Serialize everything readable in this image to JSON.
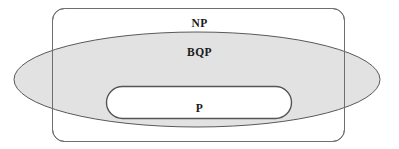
{
  "diagram": {
    "kind": "containment-venn-diagram",
    "background_color": "#ffffff",
    "regions": [
      {
        "id": "np",
        "label": "NP",
        "shape": "rounded-rectangle",
        "fill_color": "#ffffff",
        "stroke_color": "#6e6e6e",
        "stroke_width": 1,
        "x": 52,
        "y": 8,
        "width": 293,
        "height": 134,
        "corner_radius": 12,
        "label_x": 199,
        "label_y": 17
      },
      {
        "id": "bqp",
        "label": "BQP",
        "shape": "ellipse",
        "fill_color": "#dfdfdf",
        "stroke_color": "#595959",
        "stroke_width": 1,
        "center_x": 197,
        "center_y": 79.5,
        "radius_x": 183,
        "radius_y": 47.5,
        "label_x": 199,
        "label_y": 46
      },
      {
        "id": "p",
        "label": "P",
        "shape": "rounded-rectangle",
        "fill_color": "#ffffff",
        "stroke_color": "#555555",
        "stroke_width": 1.4,
        "x": 106,
        "y": 86,
        "width": 186,
        "height": 33,
        "corner_radius": 16,
        "label_x": 199,
        "label_y": 102
      }
    ]
  },
  "labels": {
    "np": "NP",
    "bqp": "BQP",
    "p": "P"
  }
}
